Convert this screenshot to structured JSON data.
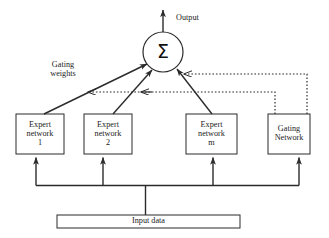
{
  "diagram": {
    "type": "block-diagram",
    "colors": {
      "stroke": "#2b2b2b",
      "box_fill": "#ffffff",
      "text": "#1a1a1a",
      "background": "#ffffff"
    },
    "output_label": "Output",
    "gating_weights_label": "Gating\nweights",
    "sum_node": {
      "symbol": "Σ",
      "name": "summation-node",
      "cx": 163,
      "cy": 52,
      "r": 20
    },
    "boxes": [
      {
        "id": "expert-1",
        "label": "Expert\nnetwork\n1",
        "x": 16,
        "y": 114,
        "w": 48,
        "h": 40
      },
      {
        "id": "expert-2",
        "label": "Expert\nnetwork\n2",
        "x": 84,
        "y": 114,
        "w": 48,
        "h": 40
      },
      {
        "id": "expert-m",
        "label": "Expert\nnetwork\nm",
        "x": 186,
        "y": 114,
        "w": 51,
        "h": 40
      },
      {
        "id": "gating-network",
        "label": "Gating\nNetwork",
        "x": 268,
        "y": 114,
        "w": 42,
        "h": 40
      }
    ],
    "input_bar": {
      "id": "input-data",
      "label": "Input data",
      "x": 57,
      "y": 215,
      "w": 183,
      "h": 13
    },
    "connections": {
      "expert_to_sum": [
        {
          "from": "expert-1",
          "to": "sum-node",
          "style": "solid",
          "arrow": "to-sum"
        },
        {
          "from": "expert-2",
          "to": "sum-node",
          "style": "solid",
          "arrow": "to-sum"
        },
        {
          "from": "expert-m",
          "to": "sum-node",
          "style": "solid",
          "arrow": "to-sum"
        }
      ],
      "gating_to_sum": [
        {
          "from": "gating-network",
          "to": "sum-node",
          "style": "dotted",
          "arrow": "to-sum"
        }
      ],
      "gating_weights": [
        {
          "from": "gating-network",
          "to": "expert-1-link",
          "style": "dotted",
          "arrow": "left"
        },
        {
          "from": "gating-network",
          "to": "expert-2-link",
          "style": "dotted",
          "arrow": "left"
        }
      ],
      "input_to_blocks": [
        {
          "from": "input-data",
          "to": "expert-1",
          "style": "solid",
          "arrow": "up"
        },
        {
          "from": "input-data",
          "to": "expert-2",
          "style": "solid",
          "arrow": "up"
        },
        {
          "from": "input-data",
          "to": "expert-m",
          "style": "solid",
          "arrow": "up"
        },
        {
          "from": "input-data",
          "to": "gating-network",
          "style": "solid",
          "arrow": "up"
        }
      ],
      "sum_to_output": {
        "from": "sum-node",
        "to": "output-label",
        "style": "solid",
        "arrow": "up"
      }
    }
  }
}
